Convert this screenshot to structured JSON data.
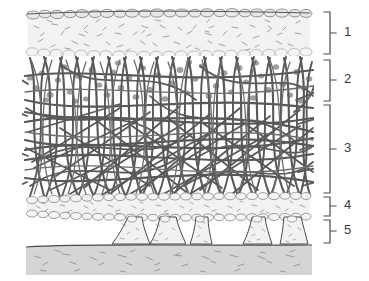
{
  "figure": {
    "background_color": "#ffffff",
    "width": 369,
    "height": 281
  },
  "palette": {
    "fiber_dark": "#58585a",
    "fiber_mid": "#6e6e70",
    "granule_gray": "#9a9a9a",
    "layer_fill_light": "#f2f2f2",
    "layer_fill_pale": "#f7f7f7",
    "substrate_fill": "#d5d5d5",
    "outline": "#4a4a4a",
    "speckle": "#8d8d8d",
    "label_text": "#3b3b3b",
    "bracket_stroke": "#4a4a4a"
  },
  "brackets": [
    {
      "id": "bracket-1",
      "label": "1",
      "top": 12,
      "bottom": 54,
      "label_y": 33
    },
    {
      "id": "bracket-2",
      "label": "2",
      "top": 60,
      "bottom": 101,
      "label_y": 80
    },
    {
      "id": "bracket-3",
      "label": "3",
      "top": 105,
      "bottom": 193,
      "label_y": 149
    },
    {
      "id": "bracket-4",
      "label": "4",
      "top": 197,
      "bottom": 216,
      "label_y": 206
    },
    {
      "id": "bracket-5",
      "label": "5",
      "top": 220,
      "bottom": 243,
      "label_y": 231
    }
  ],
  "bracket_geometry": {
    "spine_x": 330,
    "tick_length": 6,
    "tip_x": 324,
    "label_x": 344
  },
  "layers": [
    {
      "id": "layer-1",
      "number": "1",
      "name": "upper-granular-band",
      "y_top": 10,
      "y_bottom": 56,
      "fill": "#f2f2f2",
      "has_scalloped_top": true,
      "has_speckles": true,
      "has_dots": false,
      "has_fibers": false
    },
    {
      "id": "layer-2",
      "number": "2",
      "name": "fiber-network-with-granules",
      "y_top": 57,
      "y_bottom": 103,
      "fill": "#ffffff",
      "has_scalloped_top": false,
      "has_speckles": false,
      "has_dots": true,
      "has_fibers": true
    },
    {
      "id": "layer-3",
      "number": "3",
      "name": "dense-fiber-network",
      "y_top": 103,
      "y_bottom": 195,
      "fill": "#ffffff",
      "has_scalloped_top": false,
      "has_speckles": false,
      "has_dots": false,
      "has_fibers": true
    },
    {
      "id": "layer-4",
      "number": "4",
      "name": "lower-granular-band",
      "y_top": 195,
      "y_bottom": 218,
      "fill": "#f2f2f2",
      "has_scalloped_top": true,
      "has_speckles": true,
      "has_dots": false,
      "has_fibers": false
    },
    {
      "id": "layer-5",
      "number": "5",
      "name": "pillar-support-layer",
      "y_top": 218,
      "y_bottom": 245,
      "fill": "#f2f2f2",
      "has_scalloped_top": false,
      "has_speckles": true,
      "has_dots": false,
      "has_fibers": false,
      "pillar_count": 5
    },
    {
      "id": "substrate",
      "number": "",
      "name": "substrate-base",
      "y_top": 245,
      "y_bottom": 275,
      "fill": "#d5d5d5",
      "has_scalloped_top": false,
      "has_speckles": true,
      "has_dots": false,
      "has_fibers": false
    }
  ],
  "diagram_extent": {
    "left": 25,
    "right": 312
  }
}
